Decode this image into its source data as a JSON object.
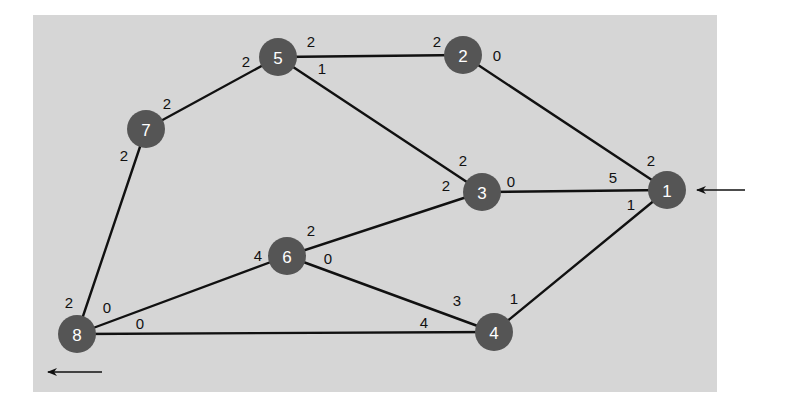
{
  "diagram": {
    "type": "network-graph",
    "colors": {
      "background": "#d6d6d6",
      "node_fill": "#555555",
      "node_text": "#ffffff",
      "edge": "#111111",
      "label_text": "#111111"
    },
    "nodes": [
      {
        "id": "1",
        "label": "1",
        "x": 667,
        "y": 190
      },
      {
        "id": "2",
        "label": "2",
        "x": 463,
        "y": 55
      },
      {
        "id": "3",
        "label": "3",
        "x": 482,
        "y": 192
      },
      {
        "id": "4",
        "label": "4",
        "x": 494,
        "y": 332
      },
      {
        "id": "5",
        "label": "5",
        "x": 278,
        "y": 57
      },
      {
        "id": "6",
        "label": "6",
        "x": 287,
        "y": 256
      },
      {
        "id": "7",
        "label": "7",
        "x": 146,
        "y": 129
      },
      {
        "id": "8",
        "label": "8",
        "x": 77,
        "y": 334
      }
    ],
    "edges": [
      {
        "from": "5",
        "to": "2",
        "label_from": "2",
        "label_to": "2"
      },
      {
        "from": "5",
        "to": "7",
        "label_from": "2",
        "label_to": "2"
      },
      {
        "from": "5",
        "to": "3",
        "label_from": "1",
        "label_to": "2"
      },
      {
        "from": "2",
        "to": "1",
        "label_from": "0",
        "label_to": "2"
      },
      {
        "from": "7",
        "to": "8",
        "label_from": "2",
        "label_to": "2"
      },
      {
        "from": "3",
        "to": "1",
        "label_from": "0",
        "label_to": "5"
      },
      {
        "from": "3",
        "to": "6",
        "label_from": "2",
        "label_to": "2"
      },
      {
        "from": "1",
        "to": "4",
        "label_from": "1",
        "label_to": "1"
      },
      {
        "from": "6",
        "to": "8",
        "label_from": "4",
        "label_to": "0"
      },
      {
        "from": "6",
        "to": "4",
        "label_from": "0",
        "label_to": "3"
      },
      {
        "from": "8",
        "to": "4",
        "label_from": "0",
        "label_to": "4"
      }
    ],
    "edge_labels": [
      {
        "text": "2",
        "x": 311,
        "y": 41,
        "edge": "5-2",
        "near": "5"
      },
      {
        "text": "2",
        "x": 437,
        "y": 41,
        "edge": "5-2",
        "near": "2"
      },
      {
        "text": "2",
        "x": 246,
        "y": 61,
        "edge": "5-7",
        "near": "5"
      },
      {
        "text": "2",
        "x": 167,
        "y": 103,
        "edge": "5-7",
        "near": "7"
      },
      {
        "text": "1",
        "x": 322,
        "y": 68,
        "edge": "5-3",
        "near": "5"
      },
      {
        "text": "2",
        "x": 463,
        "y": 160,
        "edge": "5-3",
        "near": "3"
      },
      {
        "text": "0",
        "x": 497,
        "y": 55,
        "edge": "2-1",
        "near": "2"
      },
      {
        "text": "2",
        "x": 651,
        "y": 160,
        "edge": "2-1",
        "near": "1"
      },
      {
        "text": "2",
        "x": 124,
        "y": 155,
        "edge": "7-8",
        "near": "7"
      },
      {
        "text": "2",
        "x": 69,
        "y": 302,
        "edge": "7-8",
        "near": "8"
      },
      {
        "text": "0",
        "x": 511,
        "y": 181,
        "edge": "3-1",
        "near": "3"
      },
      {
        "text": "5",
        "x": 613,
        "y": 177,
        "edge": "3-1",
        "near": "1"
      },
      {
        "text": "2",
        "x": 446,
        "y": 185,
        "edge": "3-6",
        "near": "3"
      },
      {
        "text": "2",
        "x": 311,
        "y": 230,
        "edge": "3-6",
        "near": "6"
      },
      {
        "text": "1",
        "x": 631,
        "y": 204,
        "edge": "1-4",
        "near": "1"
      },
      {
        "text": "1",
        "x": 514,
        "y": 298,
        "edge": "1-4",
        "near": "4"
      },
      {
        "text": "4",
        "x": 258,
        "y": 255,
        "edge": "6-8",
        "near": "6"
      },
      {
        "text": "0",
        "x": 107,
        "y": 307,
        "edge": "6-8",
        "near": "8"
      },
      {
        "text": "0",
        "x": 328,
        "y": 258,
        "edge": "6-4",
        "near": "6"
      },
      {
        "text": "3",
        "x": 457,
        "y": 300,
        "edge": "6-4",
        "near": "4"
      },
      {
        "text": "0",
        "x": 140,
        "y": 323,
        "edge": "8-4",
        "near": "8"
      },
      {
        "text": "4",
        "x": 424,
        "y": 322,
        "edge": "8-4",
        "near": "4"
      }
    ],
    "arrows": [
      {
        "name": "source-arrow",
        "direction": "left",
        "x1": 745,
        "y1": 190,
        "x2": 697,
        "y2": 190,
        "points_to": "1"
      },
      {
        "name": "sink-arrow",
        "direction": "left",
        "x1": 102,
        "y1": 372,
        "x2": 48,
        "y2": 372,
        "points_from": "8"
      }
    ]
  }
}
